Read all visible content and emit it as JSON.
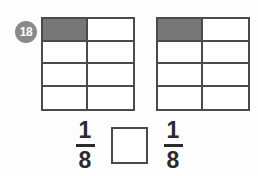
{
  "item": {
    "number_badge": "18",
    "badge_color": "#8a8a8a",
    "background_color": "#fdfdfd",
    "line_color": "#4a4a4a",
    "shade_color": "#77777a"
  },
  "models": [
    {
      "name": "left-fraction-grid",
      "columns": 2,
      "rows": 4,
      "total_cells": 8,
      "shaded_cells": 1,
      "shaded_positions": [
        0
      ],
      "represents": "1/8"
    },
    {
      "name": "right-fraction-grid",
      "columns": 2,
      "rows": 4,
      "total_cells": 8,
      "shaded_cells": 1,
      "shaded_positions": [
        0
      ],
      "represents": "1/8"
    }
  ],
  "expression": {
    "left_fraction": {
      "numerator": "1",
      "denominator": "8"
    },
    "answer_box": {
      "value": "",
      "placeholder": ""
    },
    "right_fraction": {
      "numerator": "1",
      "denominator": "8"
    }
  }
}
